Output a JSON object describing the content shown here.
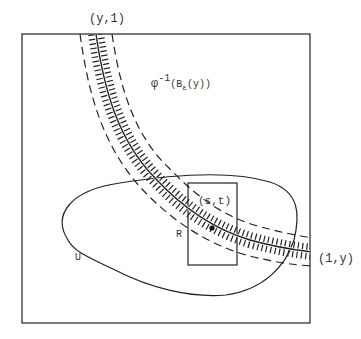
{
  "diagram": {
    "type": "topology-figure",
    "labels": {
      "top_point": "(y,1)",
      "right_point": "(1,y)",
      "preimage_prefix": "φ",
      "preimage_exp": "-1",
      "preimage_open": "(B",
      "preimage_sub": "ε",
      "preimage_close": "(y))",
      "point": "(s,t)",
      "rect": "R",
      "region": "U"
    },
    "colors": {
      "stroke": "#222222",
      "text": "#333333",
      "background": "#ffffff"
    },
    "elements": [
      {
        "name": "outer-square",
        "kind": "rectangle"
      },
      {
        "name": "region-U",
        "kind": "closed-curve"
      },
      {
        "name": "rectangle-R",
        "kind": "rectangle"
      },
      {
        "name": "curve",
        "kind": "path",
        "from": "(y,1)",
        "to": "(1,y)"
      },
      {
        "name": "epsilon-neighborhood",
        "kind": "hatched-band"
      },
      {
        "name": "point-st",
        "kind": "dot"
      }
    ]
  }
}
